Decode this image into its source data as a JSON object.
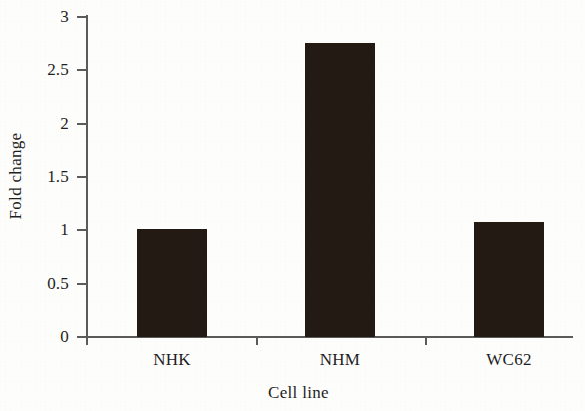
{
  "chart_data": {
    "type": "bar",
    "title": "",
    "subtitle": "",
    "xlabel": "Cell line",
    "ylabel": "Fold change",
    "categories": [
      "NHK",
      "NHM",
      "WC62"
    ],
    "values": [
      1.01,
      2.76,
      1.08
    ],
    "series": [
      {
        "name": "Fold change",
        "values": [
          1.01,
          2.76,
          1.08
        ]
      }
    ],
    "ylim": [
      0,
      3
    ],
    "yticks": [
      0,
      0.5,
      1,
      1.5,
      2,
      2.5,
      3
    ],
    "ytick_labels": [
      "0",
      "0.5",
      "1",
      "1.5",
      "2",
      "2.5",
      "3"
    ],
    "xtick_labels": [
      "NHK",
      "NHM",
      "WC62"
    ],
    "grid": false,
    "legend": null,
    "legend_position": "none",
    "annotations": [],
    "bar_color": "#231a13",
    "axis_color": "#5b5b5b",
    "background_color": "#fdfdfc",
    "text_color": "#1f1f1f"
  },
  "axes": {
    "y_title": "Fold change",
    "x_title": "Cell line",
    "y_ticks": [
      {
        "label": "3",
        "value": 3
      },
      {
        "label": "2.5",
        "value": 2.5
      },
      {
        "label": "2",
        "value": 2
      },
      {
        "label": "1.5",
        "value": 1.5
      },
      {
        "label": "1",
        "value": 1
      },
      {
        "label": "0.5",
        "value": 0.5
      },
      {
        "label": "0",
        "value": 0
      }
    ]
  },
  "bars": [
    {
      "label": "NHK",
      "value": 1.01
    },
    {
      "label": "NHM",
      "value": 2.76
    },
    {
      "label": "WC62",
      "value": 1.08
    }
  ]
}
